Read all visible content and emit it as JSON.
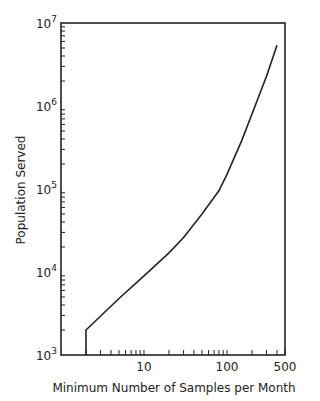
{
  "chart_data": {
    "type": "line",
    "title": "",
    "xlabel": "Minimum Number of Samples per Month",
    "ylabel": "Population Served",
    "xscale": "log",
    "yscale": "log",
    "xlim": [
      1,
      500
    ],
    "ylim": [
      1000,
      10000000
    ],
    "x_tick_labels": [
      "10",
      "100",
      "500"
    ],
    "y_tick_labels": [
      {
        "base": "10",
        "exp": "3"
      },
      {
        "base": "10",
        "exp": "4"
      },
      {
        "base": "10",
        "exp": "5"
      },
      {
        "base": "10",
        "exp": "6"
      },
      {
        "base": "10",
        "exp": "7"
      }
    ],
    "grid": false,
    "series": [
      {
        "name": "Population served vs minimum samples",
        "x": [
          2,
          2,
          5,
          10,
          20,
          30,
          50,
          80,
          100,
          150,
          200,
          300,
          400
        ],
        "y": [
          1000,
          2000,
          4800,
          9000,
          17000,
          26000,
          50000,
          95000,
          150000,
          380000,
          800000,
          2300000,
          5400000
        ]
      }
    ]
  }
}
